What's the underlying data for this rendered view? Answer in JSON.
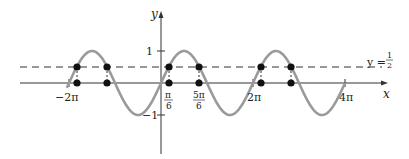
{
  "chart_data": {
    "type": "line",
    "title": "",
    "xlabel": "x",
    "ylabel": "y",
    "series": [
      {
        "name": "y = sin x",
        "function": "sin(x)",
        "color": "#9a9a9a",
        "x_range": [
          "-2π - π/2 (approx)",
          "4π"
        ]
      },
      {
        "name": "y = 1/2",
        "function": "0.5",
        "style": "dashed",
        "color": "#333333"
      }
    ],
    "intersection_points": [
      {
        "x": "-2π + π/6",
        "y": 0.5
      },
      {
        "x": "-2π + 5π/6",
        "y": 0.5
      },
      {
        "x": "π/6",
        "y": 0.5
      },
      {
        "x": "5π/6",
        "y": 0.5
      },
      {
        "x": "2π + π/6",
        "y": 0.5
      },
      {
        "x": "2π + 5π/6",
        "y": 0.5
      }
    ],
    "x_ticks": [
      {
        "label": "−2π",
        "value": -6.2832
      },
      {
        "label": "π/6",
        "value": 0.5236
      },
      {
        "label": "5π/6",
        "value": 2.618
      },
      {
        "label": "2π",
        "value": 6.2832
      },
      {
        "label": "4π",
        "value": 12.5664
      }
    ],
    "y_ticks": [
      {
        "label": "1",
        "value": 1
      },
      {
        "label": "−1",
        "value": -1
      }
    ],
    "annotations": [
      {
        "text": "y = 1/2",
        "position": "right end of dashed line"
      }
    ],
    "grid": false,
    "ylim": [
      -2.2,
      2.2
    ]
  },
  "labels": {
    "y_axis": "y",
    "x_axis": "x",
    "y_one": "1",
    "y_neg_one": "−1",
    "x_neg_2pi": "−2π",
    "x_pi_num": "π",
    "x_pi_den": "6",
    "x_5pi_num": "5π",
    "x_5pi_den": "6",
    "x_2pi": "2π",
    "x_4pi": "4π",
    "line_label_prefix": "y =",
    "line_label_num": "1",
    "line_label_den": "2"
  }
}
